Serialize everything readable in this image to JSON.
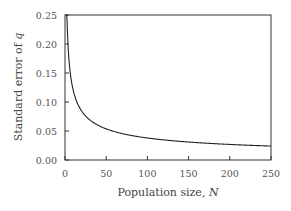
{
  "chart_data": {
    "type": "line",
    "title": "",
    "xlabel": "Population size, N",
    "ylabel": "Standard error of q",
    "xlim": [
      0,
      250
    ],
    "ylim": [
      0,
      0.25
    ],
    "xticks": [
      "0",
      "50",
      "100",
      "150",
      "200",
      "250"
    ],
    "yticks": [
      "0.00",
      "0.05",
      "0.10",
      "0.15",
      "0.20",
      "0.25"
    ],
    "grid": false,
    "legend": null,
    "series": [
      {
        "name": "standard error",
        "x": [
          2,
          3,
          5,
          10,
          20,
          30,
          50,
          75,
          100,
          150,
          200,
          250
        ],
        "y": [
          0.269,
          0.219,
          0.17,
          0.12,
          0.085,
          0.069,
          0.054,
          0.044,
          0.038,
          0.031,
          0.027,
          0.024
        ]
      }
    ]
  }
}
